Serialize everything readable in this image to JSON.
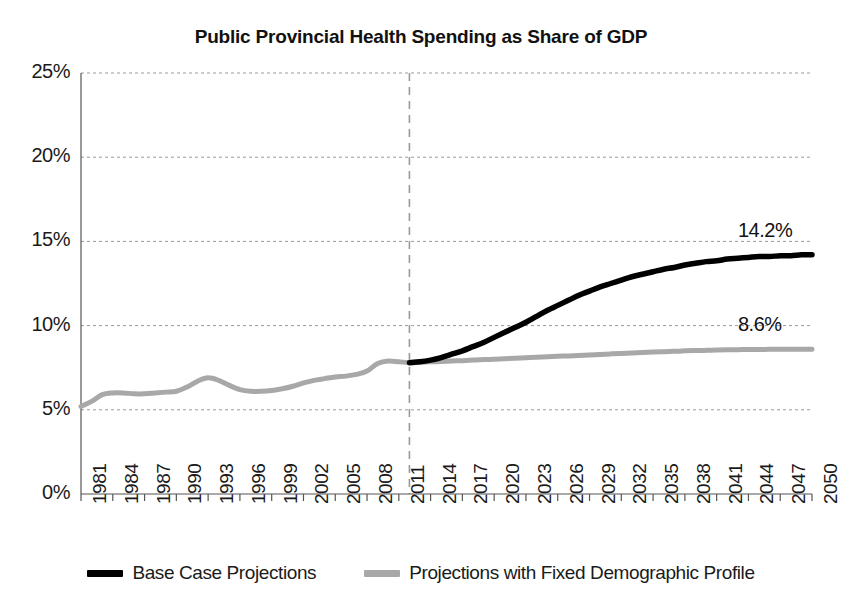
{
  "chart_data": {
    "type": "line",
    "title": "Public Provincial Health Spending as Share of GDP",
    "xlabel": "",
    "ylabel": "",
    "ylim": [
      0,
      25
    ],
    "xlim": [
      1981,
      2050
    ],
    "ytick_labels": [
      "0%",
      "5%",
      "10%",
      "15%",
      "20%",
      "25%"
    ],
    "ytick_values": [
      0,
      5,
      10,
      15,
      20,
      25
    ],
    "grid": true,
    "grid_style": "dashed",
    "legend_position": "bottom",
    "xtick_labels": [
      "1981",
      "1984",
      "1987",
      "1990",
      "1993",
      "1996",
      "1999",
      "2002",
      "2005",
      "2008",
      "2011",
      "2014",
      "2017",
      "2020",
      "2023",
      "2026",
      "2029",
      "2032",
      "2035",
      "2038",
      "2041",
      "2044",
      "2047",
      "2050"
    ],
    "xtick_rotation": 90,
    "annotations": [
      {
        "text": "14.2%",
        "series": "Base Case Projections",
        "x": 2050,
        "y": 14.2
      },
      {
        "text": "8.6%",
        "series": "Projections with Fixed Demographic Profile",
        "x": 2050,
        "y": 8.6
      }
    ],
    "vertical_marker": {
      "x": 2012,
      "style": "dashed",
      "color": "#9a9a9a",
      "label": ""
    },
    "series": [
      {
        "name": "Base Case Projections",
        "color": "#000000",
        "x": [
          2012,
          2013,
          2014,
          2015,
          2016,
          2017,
          2018,
          2019,
          2020,
          2021,
          2022,
          2023,
          2024,
          2025,
          2026,
          2027,
          2028,
          2029,
          2030,
          2031,
          2032,
          2033,
          2034,
          2035,
          2036,
          2037,
          2038,
          2039,
          2040,
          2041,
          2042,
          2043,
          2044,
          2045,
          2046,
          2047,
          2048,
          2049,
          2050
        ],
        "values": [
          7.8,
          7.85,
          7.95,
          8.1,
          8.3,
          8.5,
          8.75,
          9.0,
          9.3,
          9.6,
          9.9,
          10.2,
          10.55,
          10.9,
          11.2,
          11.5,
          11.8,
          12.05,
          12.3,
          12.5,
          12.7,
          12.9,
          13.05,
          13.2,
          13.35,
          13.45,
          13.6,
          13.7,
          13.8,
          13.85,
          13.95,
          14.0,
          14.05,
          14.1,
          14.1,
          14.15,
          14.15,
          14.2,
          14.2
        ]
      },
      {
        "name": "Projections with Fixed Demographic Profile",
        "color": "#a8a8a8",
        "x": [
          1981,
          1982,
          1983,
          1984,
          1985,
          1986,
          1987,
          1988,
          1989,
          1990,
          1991,
          1992,
          1993,
          1994,
          1995,
          1996,
          1997,
          1998,
          1999,
          2000,
          2001,
          2002,
          2003,
          2004,
          2005,
          2006,
          2007,
          2008,
          2009,
          2010,
          2011,
          2012,
          2013,
          2014,
          2015,
          2016,
          2017,
          2018,
          2019,
          2020,
          2021,
          2022,
          2023,
          2024,
          2025,
          2026,
          2027,
          2028,
          2029,
          2030,
          2031,
          2032,
          2033,
          2034,
          2035,
          2036,
          2037,
          2038,
          2039,
          2040,
          2041,
          2042,
          2043,
          2044,
          2045,
          2046,
          2047,
          2048,
          2049,
          2050
        ],
        "values": [
          5.2,
          5.5,
          5.9,
          6.0,
          6.0,
          5.95,
          5.95,
          6.0,
          6.05,
          6.1,
          6.35,
          6.7,
          6.9,
          6.75,
          6.45,
          6.2,
          6.1,
          6.1,
          6.15,
          6.25,
          6.4,
          6.6,
          6.75,
          6.85,
          6.95,
          7.0,
          7.1,
          7.3,
          7.75,
          7.9,
          7.85,
          7.8,
          7.82,
          7.85,
          7.87,
          7.9,
          7.92,
          7.95,
          7.98,
          8.0,
          8.03,
          8.06,
          8.09,
          8.12,
          8.15,
          8.18,
          8.2,
          8.23,
          8.26,
          8.29,
          8.32,
          8.35,
          8.38,
          8.4,
          8.43,
          8.45,
          8.47,
          8.5,
          8.52,
          8.53,
          8.55,
          8.56,
          8.57,
          8.58,
          8.58,
          8.59,
          8.59,
          8.6,
          8.6,
          8.6
        ]
      }
    ]
  },
  "legend": {
    "items": [
      {
        "label": "Base Case Projections",
        "color": "#000000"
      },
      {
        "label": "Projections with Fixed Demographic Profile",
        "color": "#a8a8a8"
      }
    ]
  },
  "colors": {
    "base_case": "#000000",
    "fixed_demographic": "#a8a8a8",
    "grid": "#9a9a9a",
    "axis": "#555555",
    "text": "#1a1a1a"
  }
}
